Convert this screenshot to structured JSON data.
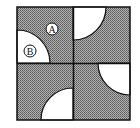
{
  "diagram": {
    "title": "",
    "labels": {
      "region_a": "A",
      "region_b": "B"
    },
    "colors": {
      "shade": "#8c8c8c",
      "white": "#ffffff",
      "line": "#111111"
    }
  }
}
